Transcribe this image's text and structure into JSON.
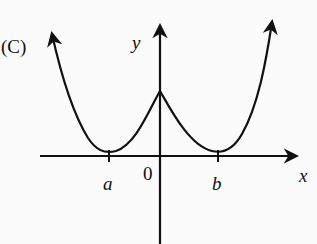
{
  "figure": {
    "option_label": "(C)",
    "axes": {
      "x_label": "x",
      "y_label": "y",
      "origin_label": "0",
      "tick_labels": [
        "a",
        "b"
      ]
    },
    "curve": {
      "description": "Symmetric W-shaped curve with cusp peak at y-axis, minima tangent to x-axis at a and b, both ends rising with arrows",
      "color": "#111111"
    }
  }
}
